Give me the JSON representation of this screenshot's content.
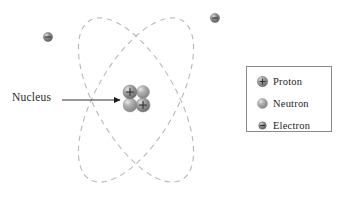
{
  "figure": {
    "type": "atomic-structure-diagram",
    "background_color": "#ffffff",
    "callout": {
      "label": "Nucleus",
      "arrow": {
        "from_x": 62,
        "from_y": 100,
        "to_x": 122,
        "to_y": 100,
        "color": "#1a1a1a"
      }
    },
    "orbits": [
      {
        "name": "orbit-1",
        "center_x": 136,
        "center_y": 100,
        "rx": 40,
        "ry": 92,
        "rotation_deg": 30,
        "style": "dashed",
        "color": "#b9b9b9"
      },
      {
        "name": "orbit-2",
        "center_x": 136,
        "center_y": 100,
        "rx": 40,
        "ry": 92,
        "rotation_deg": -30,
        "style": "dashed",
        "color": "#b9b9b9"
      }
    ],
    "nucleus": {
      "center_x": 136,
      "center_y": 99,
      "particles": [
        {
          "kind": "proton",
          "label": "+",
          "cx": 130,
          "cy": 92,
          "r": 7.0
        },
        {
          "kind": "neutron",
          "label": "",
          "cx": 143,
          "cy": 92,
          "r": 6.5
        },
        {
          "kind": "neutron",
          "label": "",
          "cx": 130,
          "cy": 105,
          "r": 7.0
        },
        {
          "kind": "proton",
          "label": "+",
          "cx": 143,
          "cy": 105,
          "r": 7.0
        }
      ]
    },
    "electrons": [
      {
        "name": "electron-upper-left",
        "label": "−",
        "cx": 48,
        "cy": 37,
        "r": 4.6
      },
      {
        "name": "electron-upper-right",
        "label": "−",
        "cx": 215,
        "cy": 18,
        "r": 4.6
      }
    ]
  },
  "legend": {
    "border_color": "#8a8a8a",
    "items": [
      {
        "key": "proton",
        "label": "Proton",
        "symbol": "+",
        "radius": 5.2
      },
      {
        "key": "neutron",
        "label": "Neutron",
        "symbol": "",
        "radius": 5.0
      },
      {
        "key": "electron",
        "label": "Electron",
        "symbol": "−",
        "radius": 3.8
      }
    ]
  },
  "colors": {
    "proton_fill": "#7d7d7d",
    "proton_highlight": "#c9c9c9",
    "neutron_fill": "#9a9a9a",
    "neutron_highlight": "#d6d6d6",
    "electron_fill": "#6f6f6f",
    "electron_highlight": "#c0c0c0",
    "orbit": "#b9b9b9",
    "arrow": "#1a1a1a",
    "text": "#242424"
  }
}
